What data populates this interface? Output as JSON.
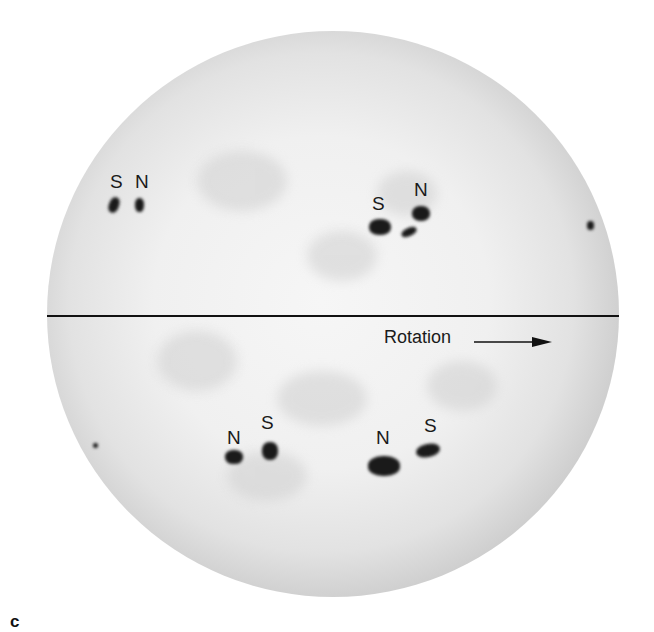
{
  "figure": {
    "panel_label": "c",
    "equator_line": true,
    "rotation": {
      "label": "Rotation",
      "arrow_direction": "right"
    },
    "colors": {
      "disk_center": "#f0f0f0",
      "disk_limb": "#7c7c7c",
      "spots": "#1a1a1a",
      "text": "#1a1a1a"
    }
  },
  "hemispheres": {
    "northern": {
      "groups": [
        {
          "leading": "N",
          "trailing": "S",
          "labels": [
            "S",
            "N"
          ]
        },
        {
          "leading": "N",
          "trailing": "S",
          "labels": [
            "S",
            "N"
          ]
        }
      ]
    },
    "southern": {
      "groups": [
        {
          "leading": "S",
          "trailing": "N",
          "labels": [
            "N",
            "S"
          ]
        },
        {
          "leading": "S",
          "trailing": "N",
          "labels": [
            "N",
            "S"
          ]
        }
      ]
    }
  }
}
